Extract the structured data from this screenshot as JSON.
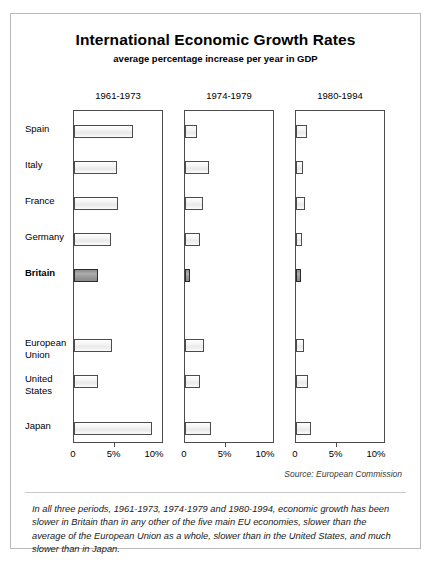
{
  "figure": {
    "title": "International Economic Growth Rates",
    "subtitle": "average percentage increase per year in GDP",
    "source": "Source: European Commission",
    "caption": "In all three periods, 1961-1973, 1974-1979 and 1980-1994, economic growth has been slower in Britain than in any other of the five main EU economies, slower than the average of the European Union as a whole, slower than in the United States, and much slower than in Japan.",
    "tick_labels": [
      "0",
      "5%",
      "10%"
    ],
    "highlight_row": "Britain",
    "colors": {
      "bar_fill": "#ededed",
      "bar_border": "#4c4c4c",
      "highlight_fill": "#9a9a9a",
      "highlight_border": "#2b2b2b",
      "frame": "#b9b9b9",
      "text": "#000000"
    }
  },
  "chart_data": {
    "type": "bar",
    "title": "International Economic Growth Rates",
    "subtitle": "average percentage increase per year in GDP",
    "xlabel": "",
    "ylabel": "",
    "xlim": [
      0,
      10
    ],
    "xticks": [
      0,
      5,
      10
    ],
    "xtick_labels": [
      "0",
      "5%",
      "10%"
    ],
    "grid": false,
    "legend": "none",
    "orientation": "horizontal",
    "categories": [
      "Spain",
      "Italy",
      "France",
      "Germany",
      "Britain",
      "European Union",
      "United States",
      "Japan"
    ],
    "panels": [
      "1961-1973",
      "1974-1979",
      "1980-1994"
    ],
    "series": [
      {
        "name": "1961-1973",
        "values": [
          7.3,
          5.3,
          5.4,
          4.6,
          3.0,
          4.7,
          3.0,
          9.6
        ]
      },
      {
        "name": "1974-1979",
        "values": [
          1.5,
          3.0,
          2.2,
          1.8,
          0.6,
          2.3,
          1.8,
          3.2
        ]
      },
      {
        "name": "1980-1994",
        "values": [
          1.3,
          0.9,
          1.1,
          0.8,
          0.6,
          1.0,
          1.5,
          1.9
        ]
      }
    ],
    "annotation": "In all three periods, 1961-1973, 1974-1979 and 1980-1994, economic growth has been slower in Britain than in any other of the five main EU economies, slower than the average of the European Union as a whole, slower than in the United States, and much slower than in Japan.",
    "source": "Source: European Commission"
  }
}
